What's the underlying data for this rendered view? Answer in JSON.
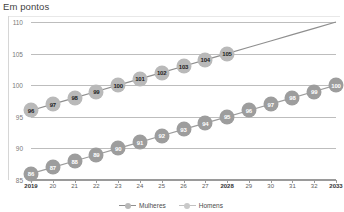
{
  "chart_data": {
    "type": "line",
    "title": "Em pontos",
    "xlabel": "",
    "ylabel": "",
    "ylim": [
      85,
      110
    ],
    "yticks": [
      85,
      90,
      95,
      100,
      105,
      110
    ],
    "grid": true,
    "legend_position": "bottom-center",
    "x": [
      2019,
      2020,
      2021,
      2022,
      2023,
      2024,
      2025,
      2026,
      2027,
      2028,
      2029,
      2030,
      2031,
      2032,
      2033
    ],
    "categories": [
      "2019",
      "20",
      "21",
      "22",
      "23",
      "24",
      "25",
      "26",
      "27",
      "2028",
      "29",
      "30",
      "31",
      "32",
      "2033"
    ],
    "emphasis_categories": [
      "2019",
      "2028",
      "2033"
    ],
    "series": [
      {
        "name": "Mulheres",
        "color": "#8f8f8f",
        "marker_color": "#b9b9b9",
        "values": [
          96,
          97,
          98,
          99,
          100,
          101,
          102,
          103,
          104,
          105,
          106,
          107,
          108,
          109,
          110
        ],
        "labels": [
          "96",
          "97",
          "98",
          "99",
          "100",
          "101",
          "102",
          "103",
          "104",
          "105",
          "",
          "",
          "",
          "",
          ""
        ]
      },
      {
        "name": "Homens",
        "color": "#9d9d9d",
        "marker_color": "#9d9d9d",
        "values": [
          86,
          87,
          88,
          89,
          90,
          91,
          92,
          93,
          94,
          95,
          96,
          97,
          98,
          99,
          100
        ],
        "labels": [
          "86",
          "87",
          "88",
          "89",
          "90",
          "91",
          "92",
          "93",
          "94",
          "95",
          "96",
          "97",
          "98",
          "99",
          "100"
        ]
      }
    ]
  },
  "legend": {
    "items": [
      {
        "label": "Mulheres"
      },
      {
        "label": "Homens"
      }
    ]
  }
}
